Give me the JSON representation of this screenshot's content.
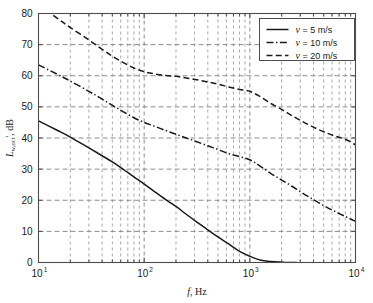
{
  "chart_data": {
    "type": "line",
    "title": "",
    "xlabel": "f, Hz",
    "ylabel": "L_w,oct', dB",
    "xlabel_parts": {
      "italic": "f",
      "rest": ", Hz"
    },
    "ylabel_parts": {
      "italic": "L",
      "sub": "w,oct",
      "prime": "'",
      "rest": ", dB"
    },
    "xscale": "log",
    "yscale": "linear",
    "xlim": [
      10,
      10000
    ],
    "ylim": [
      0,
      80
    ],
    "grid": true,
    "grid_major": true,
    "grid_minor": true,
    "xticks": [
      10,
      100,
      1000,
      10000
    ],
    "xtick_labels": [
      "10¹",
      "10²",
      "10³",
      "10⁴"
    ],
    "xtick_bases": [
      "10",
      "10",
      "10",
      "10"
    ],
    "xtick_exponents": [
      "1",
      "2",
      "3",
      "4"
    ],
    "yticks": [
      0,
      10,
      20,
      30,
      40,
      50,
      60,
      70,
      80
    ],
    "ytick_labels": [
      "0",
      "10",
      "20",
      "30",
      "40",
      "50",
      "60",
      "70",
      "80"
    ],
    "legend_position": "top-right",
    "series": [
      {
        "name": "v = 5 m/s",
        "label_italic": "v",
        "label_rest": " = 5 m/s",
        "style": "solid",
        "color": "#1a1a1a",
        "x": [
          10,
          15,
          20,
          30,
          40,
          50,
          63,
          80,
          100,
          125,
          160,
          200,
          250,
          315,
          400,
          500,
          630,
          800,
          1000,
          1250,
          1600,
          2000,
          2500,
          2800
        ],
        "y": [
          45.5,
          42.5,
          40.3,
          36.8,
          34.3,
          32.3,
          30.0,
          27.5,
          25.2,
          22.8,
          20.2,
          18.0,
          15.5,
          13.0,
          10.5,
          8.2,
          6.0,
          3.6,
          2.0,
          0.8,
          0.3,
          0.1,
          0.0,
          0.0
        ]
      },
      {
        "name": "v = 10 m/s",
        "label_italic": "v",
        "label_rest": " = 10 m/s",
        "style": "dashdot",
        "color": "#1a1a1a",
        "x": [
          10,
          15,
          20,
          30,
          40,
          50,
          63,
          80,
          100,
          125,
          160,
          200,
          250,
          315,
          400,
          500,
          630,
          800,
          1000,
          1250,
          1600,
          2000,
          2500,
          3150,
          4000,
          5000,
          6300,
          8000,
          10000
        ],
        "y": [
          63.5,
          60.5,
          58.3,
          55.0,
          52.5,
          50.5,
          48.5,
          46.5,
          45.0,
          43.8,
          42.4,
          41.2,
          40.0,
          38.8,
          37.5,
          36.3,
          35.0,
          34.0,
          33.0,
          31.0,
          28.5,
          26.5,
          24.5,
          22.3,
          20.2,
          18.3,
          16.5,
          14.8,
          13.2
        ]
      },
      {
        "name": "v = 20 m/s",
        "label_italic": "v",
        "label_rest": " = 20 m/s",
        "style": "dashed",
        "color": "#1a1a1a",
        "x": [
          10,
          15,
          20,
          30,
          40,
          50,
          63,
          80,
          100,
          125,
          160,
          200,
          250,
          315,
          400,
          500,
          630,
          800,
          1000,
          1250,
          1600,
          2000,
          2500,
          3150,
          4000,
          5000,
          6300,
          8000,
          10000
        ],
        "y": [
          83.0,
          78.5,
          75.5,
          71.5,
          68.5,
          66.3,
          64.3,
          62.5,
          61.3,
          60.6,
          60.1,
          59.8,
          59.3,
          58.7,
          58.0,
          57.3,
          56.4,
          55.6,
          55.0,
          53.3,
          51.0,
          49.2,
          47.2,
          45.3,
          43.5,
          42.0,
          40.7,
          39.6,
          37.8
        ]
      }
    ]
  },
  "legend": {
    "items": [
      {
        "label_italic": "v",
        "label_rest": " = 5 m/s",
        "style": "solid"
      },
      {
        "label_italic": "v",
        "label_rest": " = 10 m/s",
        "style": "dashdot"
      },
      {
        "label_italic": "v",
        "label_rest": " = 20 m/s",
        "style": "dashed"
      }
    ]
  },
  "colors": {
    "axis": "#4d4d4d",
    "grid": "#808080",
    "curve": "#1a1a1a",
    "text": "#1a1a1a",
    "background": "#ffffff"
  }
}
